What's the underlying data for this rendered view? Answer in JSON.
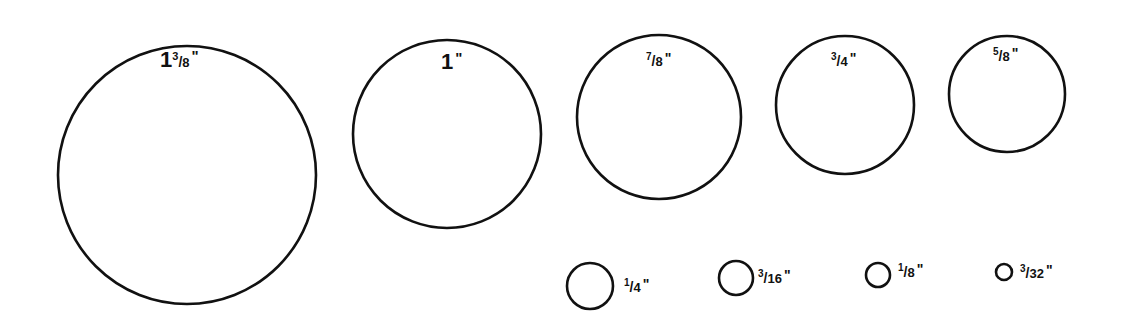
{
  "sizes": [
    {
      "id": "s1-3-8",
      "whole": "1",
      "num": "3",
      "den": "8",
      "inch": "\"",
      "cx": 187,
      "cy": 175,
      "r": 129,
      "label_x": 160,
      "label_y": 48
    },
    {
      "id": "s1",
      "whole": "1",
      "num": "",
      "den": "",
      "inch": "\"",
      "cx": 447,
      "cy": 134,
      "r": 94,
      "label_x": 441,
      "label_y": 50
    },
    {
      "id": "s7-8",
      "whole": "",
      "num": "7",
      "den": "8",
      "inch": "\"",
      "cx": 659,
      "cy": 117,
      "r": 82,
      "label_x": 646,
      "label_y": 51
    },
    {
      "id": "s3-4",
      "whole": "",
      "num": "3",
      "den": "4",
      "inch": "\"",
      "cx": 845,
      "cy": 105,
      "r": 69,
      "label_x": 831,
      "label_y": 51
    },
    {
      "id": "s5-8",
      "whole": "",
      "num": "5",
      "den": "8",
      "inch": "\"",
      "cx": 1007,
      "cy": 94,
      "r": 58,
      "label_x": 993,
      "label_y": 46
    },
    {
      "id": "s1-4",
      "whole": "",
      "num": "1",
      "den": "4",
      "inch": "\"",
      "cx": 590,
      "cy": 286,
      "r": 23,
      "label_x": 624,
      "label_y": 277
    },
    {
      "id": "s3-16",
      "whole": "",
      "num": "3",
      "den": "16",
      "inch": "\"",
      "cx": 736,
      "cy": 278,
      "r": 17,
      "label_x": 758,
      "label_y": 268
    },
    {
      "id": "s1-8",
      "whole": "",
      "num": "1",
      "den": "8",
      "inch": "\"",
      "cx": 878,
      "cy": 275,
      "r": 12,
      "label_x": 898,
      "label_y": 262
    },
    {
      "id": "s3-32",
      "whole": "",
      "num": "3",
      "den": "32",
      "inch": "\"",
      "cx": 1004,
      "cy": 272,
      "r": 8,
      "label_x": 1020,
      "label_y": 263
    }
  ],
  "labels": {
    "s1-3-8": "1 3/8\"",
    "s1": "1\"",
    "s7-8": "7/8\"",
    "s3-4": "3/4\"",
    "s5-8": "5/8\"",
    "s1-4": "1/4\"",
    "s3-16": "3/16\"",
    "s1-8": "1/8\"",
    "s3-32": "3/32\""
  }
}
